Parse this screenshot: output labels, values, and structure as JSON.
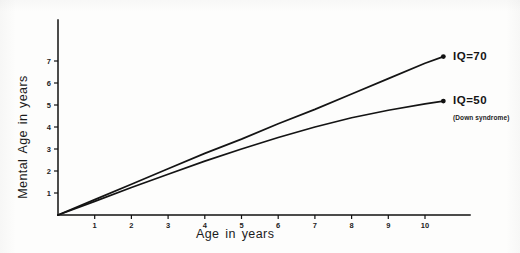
{
  "figure": {
    "background_color": "#fdfdfc",
    "ink_color": "#141414"
  },
  "axes": {
    "x_title": "Age in years",
    "y_title": "Mental Age in years",
    "x_ticks": [
      "1",
      "2",
      "3",
      "4",
      "5",
      "6",
      "7",
      "8",
      "9",
      "10"
    ],
    "y_ticks": [
      "1",
      "2",
      "3",
      "4",
      "5",
      "6",
      "7"
    ]
  },
  "labels": {
    "iq70": "IQ=70",
    "iq50": "IQ=50",
    "iq50_note": "(Down syndrome)"
  },
  "chart_data": {
    "type": "line",
    "title": "",
    "subtitle": "",
    "xlabel": "Age in years",
    "ylabel": "Mental Age in years",
    "xlim": [
      0,
      11.6
    ],
    "ylim": [
      0,
      8.9
    ],
    "xticks": [
      1,
      2,
      3,
      4,
      5,
      6,
      7,
      8,
      9,
      10
    ],
    "yticks": [
      1,
      2,
      3,
      4,
      5,
      6,
      7
    ],
    "grid": false,
    "legend": "right-of-line-endpoints",
    "series": [
      {
        "name": "IQ=70",
        "label": "IQ=70",
        "marker_at_end": true,
        "x": [
          0,
          1,
          2,
          3,
          4,
          5,
          6,
          7,
          8,
          9,
          10,
          10.5
        ],
        "y": [
          0,
          0.7,
          1.4,
          2.1,
          2.8,
          3.45,
          4.15,
          4.8,
          5.5,
          6.2,
          6.9,
          7.2
        ]
      },
      {
        "name": "IQ=50",
        "label": "IQ=50",
        "annotation": "(Down syndrome)",
        "marker_at_end": true,
        "x": [
          0,
          1,
          2,
          3,
          4,
          5,
          6,
          7,
          8,
          9,
          10,
          10.5
        ],
        "y": [
          0,
          0.62,
          1.25,
          1.85,
          2.45,
          3.0,
          3.52,
          4.0,
          4.42,
          4.76,
          5.05,
          5.18
        ]
      }
    ],
    "annotations": [
      {
        "text": "IQ=70",
        "x": 10.8,
        "y": 7.3
      },
      {
        "text": "IQ=50",
        "x": 10.8,
        "y": 5.3
      },
      {
        "text": "(Down syndrome)",
        "x": 10.8,
        "y": 4.35
      }
    ]
  }
}
